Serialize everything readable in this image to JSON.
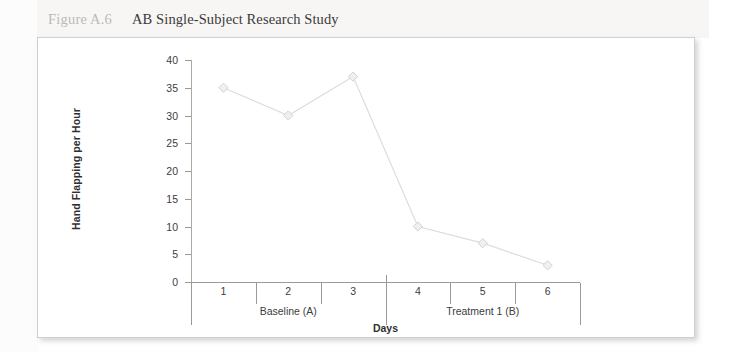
{
  "caption": {
    "figure_number": "Figure A.6",
    "title": "AB Single-Subject Research Study"
  },
  "colors": {
    "series_line": "#dcdcdc",
    "series_marker_fill": "#f0f0f0",
    "series_marker_stroke": "#d2d2d2",
    "axis": "#9a9a9a",
    "text": "#3d3d3d",
    "figure_number_text": "#bfb9b6",
    "panel_background": "#ffffff",
    "page_background": "#f7f6f5"
  },
  "chart_data": {
    "type": "line",
    "title": "AB Single-Subject Research Study",
    "xlabel": "Days",
    "ylabel": "Hand Flapping per Hour",
    "x": [
      1,
      2,
      3,
      4,
      5,
      6
    ],
    "categories": [
      "1",
      "2",
      "3",
      "4",
      "5",
      "6"
    ],
    "values": [
      35,
      30,
      37,
      10,
      7,
      3
    ],
    "series": [
      {
        "name": "Hand Flapping per Hour",
        "values": [
          35,
          30,
          37,
          10,
          7,
          3
        ]
      }
    ],
    "ylim": [
      0,
      40
    ],
    "yticks": [
      0,
      5,
      10,
      15,
      20,
      25,
      30,
      35,
      40
    ],
    "ytick_labels": [
      "0",
      "5",
      "10",
      "15",
      "20",
      "25",
      "30",
      "35",
      "40"
    ],
    "xlim": [
      0.5,
      6.5
    ],
    "grid": false,
    "legend": false,
    "marker": "diamond",
    "phases": [
      {
        "label": "Baseline (A)",
        "days": [
          "1",
          "2",
          "3"
        ],
        "start": 1,
        "end": 3
      },
      {
        "label": "Treatment 1 (B)",
        "days": [
          "4",
          "5",
          "6"
        ],
        "start": 4,
        "end": 6
      }
    ],
    "phase_divider_after_x": 3
  }
}
